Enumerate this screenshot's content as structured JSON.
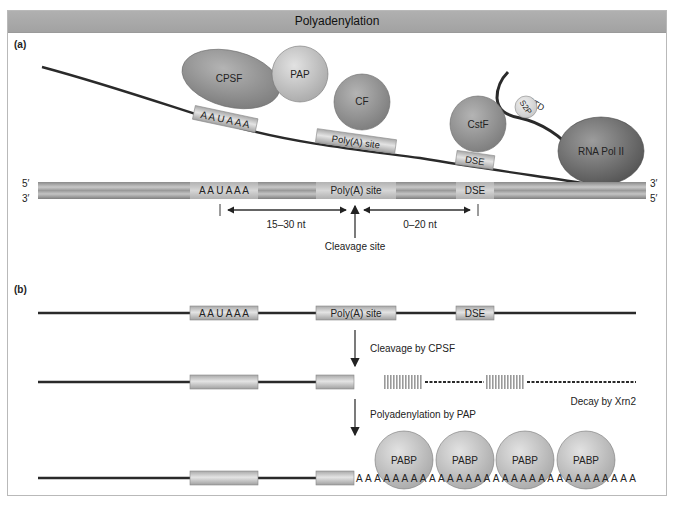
{
  "title": "Polyadenylation",
  "panel_a": {
    "label": "(a)",
    "proteins": {
      "cpsf": "CPSF",
      "pap": "PAP",
      "cf": "CF",
      "cstf": "CstF",
      "s2p": "S2P",
      "ctd": "CTD",
      "rna_pol": "RNA Pol II"
    },
    "rna_elements": {
      "aauaaa": "A A U A A A",
      "polya_site": "Poly(A) site",
      "dse": "DSE"
    },
    "dna": {
      "top_5prime": "5′",
      "bottom_3prime": "3′",
      "right_3prime": "3′",
      "right_5prime": "5′",
      "aauaaa": "A A U A A A",
      "polya_site": "Poly(A) site",
      "dse": "DSE"
    },
    "distances": {
      "upstream": "15–30 nt",
      "downstream": "0–20 nt"
    },
    "cleavage_label": "Cleavage site"
  },
  "panel_b": {
    "label": "(b)",
    "row1": {
      "aauaaa": "A A U A A A",
      "polya_site": "Poly(A) site",
      "dse": "DSE"
    },
    "step1_label": "Cleavage by CPSF",
    "decay_label": "Decay by Xrn2",
    "step2_label": "Polyadenylation by PAP",
    "pabp": [
      "PABP",
      "PABP",
      "PABP",
      "PABP"
    ],
    "polya_tail": "A A A A A A A A A A A A A A A A A A A A A A A A A A A A A A A"
  },
  "colors": {
    "protein_fill": "#8f8f8f",
    "protein_light": "#c8c8c8",
    "pol_fill": "#6e6e6e",
    "element_fill": "#c9c9c9",
    "line": "#2a2a2a",
    "titlebar": "#a8a8a8"
  }
}
